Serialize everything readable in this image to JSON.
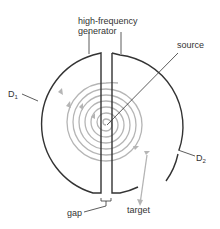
{
  "labels": {
    "generator_line1": "high-frequency",
    "generator_line2": "generator",
    "source": "source",
    "d1": "D",
    "d1_sub": "1",
    "d2": "D",
    "d2_sub": "2",
    "gap": "gap",
    "target": "target"
  },
  "colors": {
    "dee": "#333333",
    "path": "#b5b5b5",
    "text": "#333333"
  }
}
